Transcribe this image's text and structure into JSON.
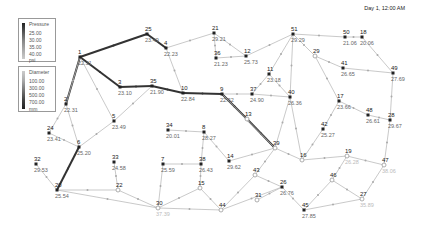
{
  "timestamp": "Day 1, 12:00 AM",
  "legend_pressure": {
    "title": "Pressure",
    "items": [
      "25.00",
      "30.00",
      "35.00",
      "40.00"
    ],
    "unit": "psi",
    "colors": [
      "#222222",
      "#555555",
      "#888888",
      "#aaaaaa",
      "#cccccc"
    ]
  },
  "legend_diameter": {
    "title": "Diameter",
    "items": [
      "100.00",
      "300.00",
      "500.00",
      "700.00"
    ],
    "unit": "mm",
    "colors": [
      "#cccccc",
      "#aaaaaa",
      "#777777",
      "#444444",
      "#222222"
    ]
  },
  "nodes": [
    {
      "id": "25",
      "x": 147,
      "y": 34,
      "v": "23.49",
      "light": false
    },
    {
      "id": "1",
      "x": 80,
      "y": 57,
      "v": "22.31",
      "light": false
    },
    {
      "id": "4",
      "x": 166,
      "y": 48,
      "v": "22.23",
      "light": false
    },
    {
      "id": "3",
      "x": 120,
      "y": 87,
      "v": "23.10",
      "light": false
    },
    {
      "id": "35",
      "x": 152,
      "y": 86,
      "v": "21.90",
      "light": false
    },
    {
      "id": "10",
      "x": 183,
      "y": 93,
      "v": "22.84",
      "light": false
    },
    {
      "id": "2",
      "x": 66,
      "y": 104,
      "v": "22.31",
      "light": false
    },
    {
      "id": "21",
      "x": 214,
      "y": 33,
      "v": "29.21",
      "light": false
    },
    {
      "id": "36",
      "x": 216,
      "y": 58,
      "v": "21.23",
      "light": false
    },
    {
      "id": "12",
      "x": 246,
      "y": 56,
      "v": "25.73",
      "light": false
    },
    {
      "id": "51",
      "x": 293,
      "y": 34,
      "v": "29.29",
      "light": false
    },
    {
      "id": "50",
      "x": 345,
      "y": 37,
      "v": "21.06",
      "light": false
    },
    {
      "id": "18",
      "x": 362,
      "y": 37,
      "v": "20.06",
      "light": false
    },
    {
      "id": "29",
      "x": 315,
      "y": 56,
      "v": "",
      "light": true
    },
    {
      "id": "41",
      "x": 343,
      "y": 68,
      "v": "26.65",
      "light": false
    },
    {
      "id": "49",
      "x": 393,
      "y": 73,
      "v": "27.69",
      "light": false
    },
    {
      "id": "11",
      "x": 269,
      "y": 74,
      "v": "23.18",
      "light": false
    },
    {
      "id": "37",
      "x": 252,
      "y": 94,
      "v": "24.90",
      "light": false
    },
    {
      "id": "9",
      "x": 222,
      "y": 94,
      "v": "22.52",
      "light": false
    },
    {
      "id": "40",
      "x": 290,
      "y": 97,
      "v": "26.36",
      "light": false
    },
    {
      "id": "17",
      "x": 339,
      "y": 101,
      "v": "23.66",
      "light": false
    },
    {
      "id": "48",
      "x": 368,
      "y": 115,
      "v": "26.61",
      "light": false
    },
    {
      "id": "28",
      "x": 390,
      "y": 120,
      "v": "29.67",
      "light": false
    },
    {
      "id": "42",
      "x": 323,
      "y": 129,
      "v": "25.27",
      "light": false
    },
    {
      "id": "5",
      "x": 114,
      "y": 121,
      "v": "23.49",
      "light": false
    },
    {
      "id": "24",
      "x": 49,
      "y": 133,
      "v": "23.41",
      "light": false
    },
    {
      "id": "6",
      "x": 79,
      "y": 147,
      "v": "25.20",
      "light": false
    },
    {
      "id": "13",
      "x": 247,
      "y": 119,
      "v": "",
      "light": true
    },
    {
      "id": "39",
      "x": 275,
      "y": 148,
      "v": "",
      "light": true
    },
    {
      "id": "16",
      "x": 302,
      "y": 160,
      "v": "",
      "light": true
    },
    {
      "id": "19",
      "x": 347,
      "y": 156,
      "v": "26.28",
      "light": true
    },
    {
      "id": "47",
      "x": 384,
      "y": 165,
      "v": "38.06",
      "light": true
    },
    {
      "id": "34",
      "x": 168,
      "y": 130,
      "v": "20.01",
      "light": false
    },
    {
      "id": "8",
      "x": 204,
      "y": 132,
      "v": "28.27",
      "light": false
    },
    {
      "id": "7",
      "x": 163,
      "y": 164,
      "v": "25.59",
      "light": false
    },
    {
      "id": "38",
      "x": 201,
      "y": 164,
      "v": "26.43",
      "light": false
    },
    {
      "id": "14",
      "x": 229,
      "y": 161,
      "v": "29.62",
      "light": false
    },
    {
      "id": "33",
      "x": 114,
      "y": 162,
      "v": "24.58",
      "light": false
    },
    {
      "id": "32",
      "x": 36,
      "y": 164,
      "v": "29.53",
      "light": false
    },
    {
      "id": "46",
      "x": 332,
      "y": 180,
      "v": "",
      "light": true
    },
    {
      "id": "43",
      "x": 255,
      "y": 175,
      "v": "",
      "light": true
    },
    {
      "id": "26",
      "x": 282,
      "y": 187,
      "v": "26.76",
      "light": false
    },
    {
      "id": "15",
      "x": 200,
      "y": 188,
      "v": "",
      "light": true
    },
    {
      "id": "22",
      "x": 118,
      "y": 190,
      "v": "",
      "light": true
    },
    {
      "id": "20",
      "x": 57,
      "y": 190,
      "v": "25.54",
      "light": false
    },
    {
      "id": "31",
      "x": 257,
      "y": 200,
      "v": "",
      "light": true
    },
    {
      "id": "27",
      "x": 362,
      "y": 199,
      "v": "35.89",
      "light": true
    },
    {
      "id": "30",
      "x": 158,
      "y": 208,
      "v": "37.39",
      "light": true
    },
    {
      "id": "44",
      "x": 221,
      "y": 210,
      "v": "",
      "light": true
    },
    {
      "id": "45",
      "x": 304,
      "y": 210,
      "v": "27.85",
      "light": false
    }
  ],
  "links": [
    [
      "1",
      "25",
      3
    ],
    [
      "25",
      "4",
      3
    ],
    [
      "1",
      "3",
      3
    ],
    [
      "3",
      "35",
      3
    ],
    [
      "35",
      "10",
      3
    ],
    [
      "10",
      "9",
      3
    ],
    [
      "9",
      "13",
      3
    ],
    [
      "13",
      "39",
      3
    ],
    [
      "2",
      "1",
      3
    ],
    [
      "6",
      "20",
      3
    ],
    [
      "4",
      "10",
      1
    ],
    [
      "4",
      "21",
      1
    ],
    [
      "21",
      "36",
      1
    ],
    [
      "36",
      "12",
      1
    ],
    [
      "21",
      "12",
      1
    ],
    [
      "12",
      "51",
      1
    ],
    [
      "51",
      "50",
      1
    ],
    [
      "50",
      "18",
      1
    ],
    [
      "18",
      "49",
      1
    ],
    [
      "51",
      "29",
      1
    ],
    [
      "29",
      "41",
      1
    ],
    [
      "41",
      "49",
      1
    ],
    [
      "49",
      "28",
      1
    ],
    [
      "29",
      "17",
      1
    ],
    [
      "17",
      "48",
      1
    ],
    [
      "48",
      "28",
      1
    ],
    [
      "17",
      "42",
      1
    ],
    [
      "42",
      "16",
      1
    ],
    [
      "51",
      "11",
      1
    ],
    [
      "11",
      "37",
      1
    ],
    [
      "11",
      "40",
      1
    ],
    [
      "9",
      "37",
      1
    ],
    [
      "37",
      "40",
      1
    ],
    [
      "51",
      "40",
      1
    ],
    [
      "40",
      "16",
      1
    ],
    [
      "16",
      "19",
      1
    ],
    [
      "19",
      "47",
      1
    ],
    [
      "28",
      "47",
      1
    ],
    [
      "47",
      "27",
      1
    ],
    [
      "19",
      "46",
      1
    ],
    [
      "46",
      "27",
      1
    ],
    [
      "46",
      "45",
      1
    ],
    [
      "27",
      "45",
      1
    ],
    [
      "26",
      "45",
      1
    ],
    [
      "39",
      "43",
      1
    ],
    [
      "43",
      "44",
      1
    ],
    [
      "43",
      "26",
      1
    ],
    [
      "31",
      "26",
      1
    ],
    [
      "44",
      "26",
      1
    ],
    [
      "1",
      "2",
      1
    ],
    [
      "2",
      "24",
      1
    ],
    [
      "2",
      "6",
      1
    ],
    [
      "1",
      "5",
      1
    ],
    [
      "5",
      "6",
      1
    ],
    [
      "24",
      "6",
      1
    ],
    [
      "5",
      "35",
      1
    ],
    [
      "32",
      "20",
      1
    ],
    [
      "20",
      "22",
      1
    ],
    [
      "33",
      "22",
      1
    ],
    [
      "22",
      "30",
      1
    ],
    [
      "20",
      "30",
      1
    ],
    [
      "7",
      "30",
      1
    ],
    [
      "30",
      "15",
      1
    ],
    [
      "15",
      "38",
      1
    ],
    [
      "38",
      "7",
      1
    ],
    [
      "34",
      "8",
      1
    ],
    [
      "8",
      "38",
      1
    ],
    [
      "8",
      "14",
      1
    ],
    [
      "14",
      "39",
      1
    ],
    [
      "15",
      "44",
      1
    ],
    [
      "30",
      "44",
      1
    ],
    [
      "39",
      "16",
      1
    ],
    [
      "39",
      "40",
      1
    ],
    [
      "9",
      "39",
      1
    ]
  ]
}
